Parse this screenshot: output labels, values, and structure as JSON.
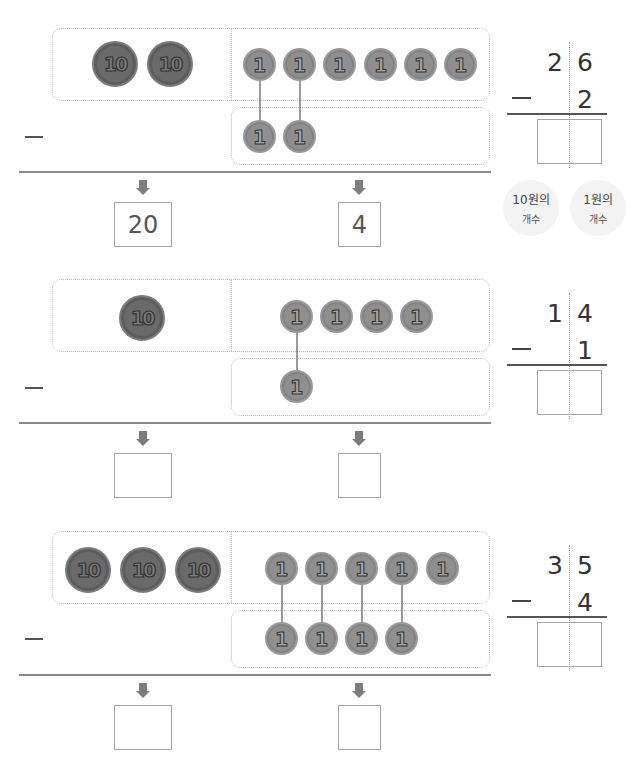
{
  "problems": [
    {
      "minuend": 26,
      "subtrahend": 2,
      "tens_coins": [
        "10",
        "10"
      ],
      "ones_coins": [
        "1",
        "1",
        "1",
        "1",
        "1",
        "1"
      ],
      "subtract_ones_coins": [
        "1",
        "1"
      ],
      "tens_answer": "20",
      "ones_answer": "4",
      "vertical": {
        "top_tens": "2",
        "top_ones": "6",
        "bottom_ones": "2",
        "minus": "—",
        "result": ""
      }
    },
    {
      "minuend": 14,
      "subtrahend": 1,
      "tens_coins": [
        "10"
      ],
      "ones_coins": [
        "1",
        "1",
        "1",
        "1"
      ],
      "subtract_ones_coins": [
        "1"
      ],
      "tens_answer": "",
      "ones_answer": "",
      "vertical": {
        "top_tens": "1",
        "top_ones": "4",
        "bottom_ones": "1",
        "minus": "—",
        "result": ""
      }
    },
    {
      "minuend": 35,
      "subtrahend": 4,
      "tens_coins": [
        "10",
        "10",
        "10"
      ],
      "ones_coins": [
        "1",
        "1",
        "1",
        "1",
        "1"
      ],
      "subtract_ones_coins": [
        "1",
        "1",
        "1",
        "1"
      ],
      "tens_answer": "",
      "ones_answer": "",
      "vertical": {
        "top_tens": "3",
        "top_ones": "5",
        "bottom_ones": "4",
        "minus": "—",
        "result": ""
      }
    }
  ],
  "labels": {
    "tens_count_line1": "10원의",
    "tens_count_line2": "개수",
    "ones_count_line1": "1원의",
    "ones_count_line2": "개수"
  },
  "colors": {
    "coin10": "#6a6a6a",
    "coin1": "#8f8f8f",
    "frame": "#b8b8b8",
    "arrow": "#7d7d7d"
  }
}
